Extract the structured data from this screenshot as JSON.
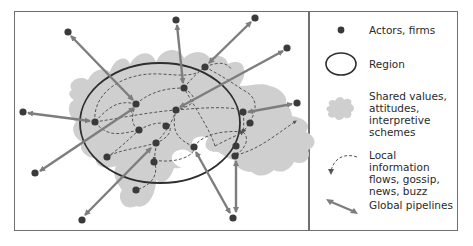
{
  "figure": {
    "colors": {
      "node": "#3a3a3a",
      "region_outline": "#2e2e2e",
      "shared_values_fill": "#cfcfcf",
      "local_flow": "#555555",
      "pipeline": "#7d7d7d",
      "border": "#6f6f6f"
    },
    "legend": [
      {
        "key": "actors",
        "icon": "dot-icon",
        "label": "Actors, firms"
      },
      {
        "key": "region",
        "icon": "ellipse-icon",
        "label": "Region"
      },
      {
        "key": "shared",
        "icon": "cloud-blob-icon",
        "label": "Shared values,\nattitudes,\ninterpretive schemes"
      },
      {
        "key": "local",
        "icon": "dashed-curve-arrow-icon",
        "label": "Local information\nflows, gossip,\nnews, buzz"
      },
      {
        "key": "global",
        "icon": "double-arrow-icon",
        "label": "Global pipelines"
      }
    ]
  }
}
